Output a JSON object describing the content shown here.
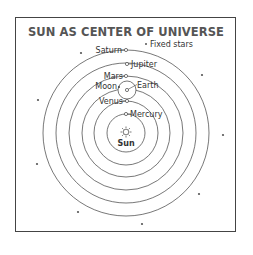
{
  "diagram": {
    "title": "SUN AS CENTER OF UNIVERSE",
    "legend": {
      "symbol": "*",
      "label": "Fixed stars"
    },
    "center": {
      "label": "Sun",
      "icon": "sun-icon"
    },
    "planets": [
      {
        "name": "Mercury",
        "label_side": "right"
      },
      {
        "name": "Venus",
        "label_side": "left"
      },
      {
        "name": "Earth",
        "label_side": "right"
      },
      {
        "name": "Mars",
        "label_side": "left"
      },
      {
        "name": "Jupiter",
        "label_side": "right"
      },
      {
        "name": "Saturn",
        "label_side": "left"
      }
    ],
    "moon": {
      "name": "Moon",
      "orbits": "Earth"
    },
    "colors": {
      "line": "#555555",
      "title": "#555555",
      "text": "#333333",
      "border": "#444444"
    }
  }
}
